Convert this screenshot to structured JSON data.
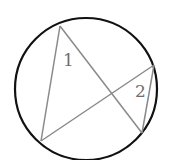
{
  "diagram": {
    "colors": {
      "circle": "#111111",
      "chords": "#8a8a8a",
      "labels": "#6e6e6e",
      "background": "#ffffff"
    },
    "circle": {
      "cx": 86,
      "cy": 89,
      "r": 71
    },
    "points": {
      "A": [
        60,
        26
      ],
      "B": [
        41,
        141
      ],
      "C": [
        154,
        65
      ],
      "D": [
        142,
        133
      ]
    },
    "segments": [
      [
        "A",
        "B"
      ],
      [
        "A",
        "D"
      ],
      [
        "B",
        "C"
      ],
      [
        "C",
        "D"
      ]
    ],
    "labels": [
      {
        "text": "1",
        "x": 63,
        "y": 66
      },
      {
        "text": "2",
        "x": 135,
        "y": 97
      }
    ]
  }
}
